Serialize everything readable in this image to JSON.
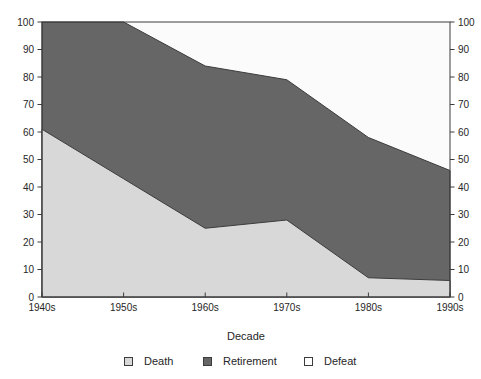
{
  "chart_data": {
    "type": "area",
    "stacked": true,
    "title": "",
    "xlabel": "Decade",
    "ylabel": "",
    "categories": [
      "1940s",
      "1950s",
      "1960s",
      "1970s",
      "1980s",
      "1990s"
    ],
    "series": [
      {
        "name": "Death",
        "values": [
          61,
          43,
          25,
          28,
          7,
          6
        ],
        "color": "#d8d8d8"
      },
      {
        "name": "Retirement",
        "values": [
          39,
          57,
          59,
          51,
          51,
          40
        ],
        "color": "#666666"
      },
      {
        "name": "Defeat",
        "values": [
          0,
          0,
          16,
          21,
          42,
          54
        ],
        "color": "#fbfbfb"
      }
    ],
    "cumulative_tops": {
      "death": [
        61,
        43,
        25,
        28,
        7,
        6
      ],
      "death_plus_retirement": [
        100,
        100,
        84,
        79,
        58,
        46
      ],
      "total": [
        100,
        100,
        100,
        100,
        100,
        100
      ]
    },
    "ylim": [
      0,
      100
    ],
    "yticks": [
      0,
      10,
      20,
      30,
      40,
      50,
      60,
      70,
      80,
      90,
      100
    ],
    "y_axis_right_mirrored": true,
    "grid": false,
    "legend_position": "bottom-center"
  },
  "colors": {
    "stroke": "#3c3c3c",
    "text": "#262626",
    "background": "#ffffff"
  }
}
